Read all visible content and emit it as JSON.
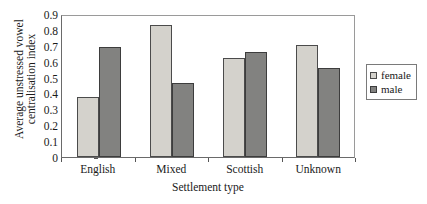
{
  "chart_data": {
    "type": "bar",
    "title": "",
    "xlabel": "Settlement type",
    "ylabel": "Average unstressed vowel centralisation index",
    "ylabel_line1": "Average unstressed vowel",
    "ylabel_line2": "centralisation index",
    "categories": [
      "English",
      "Mixed",
      "Scottish",
      "Unknown"
    ],
    "series": [
      {
        "name": "female",
        "color": "#d4d2cc",
        "values": [
          0.38,
          0.835,
          0.63,
          0.71
        ]
      },
      {
        "name": "male",
        "color": "#828280",
        "values": [
          0.695,
          0.47,
          0.665,
          0.565
        ]
      }
    ],
    "ylim": [
      0,
      0.9
    ],
    "ytick_labels": [
      "0.9",
      "0.8",
      "0.7",
      "0.6",
      "0.5",
      "0.4",
      "0.3",
      "0.2",
      "0.1",
      "0"
    ],
    "ytick_values": [
      0.9,
      0.8,
      0.7,
      0.6,
      0.5,
      0.4,
      0.3,
      0.2,
      0.1,
      0
    ],
    "grid": false,
    "legend_position": "right"
  },
  "legend": {
    "items": [
      {
        "label": "female"
      },
      {
        "label": "male"
      }
    ]
  }
}
